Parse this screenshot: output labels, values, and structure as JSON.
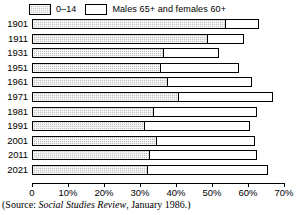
{
  "legend": {
    "entries": [
      {
        "label": "0–14",
        "style": "shaded",
        "name": "legend-swatch-young"
      },
      {
        "label": "Males 65+ and females 60+",
        "style": "open",
        "name": "legend-swatch-old"
      }
    ]
  },
  "axis": {
    "ticks": [
      {
        "value": 0,
        "label": "0"
      },
      {
        "value": 10,
        "label": "10%"
      },
      {
        "value": 20,
        "label": "20%"
      },
      {
        "value": 30,
        "label": "30%"
      },
      {
        "value": 40,
        "label": "40%"
      },
      {
        "value": 50,
        "label": "50%"
      },
      {
        "value": 60,
        "label": "60%"
      },
      {
        "value": 70,
        "label": "70%"
      }
    ]
  },
  "source": {
    "prefix": "(Source: ",
    "publication": "Social Studies Review",
    "suffix": ", January 1986.)"
  },
  "chart_data": {
    "type": "bar",
    "orientation": "horizontal",
    "stacked": true,
    "title": "",
    "xlabel": "",
    "ylabel": "",
    "xlim": [
      0,
      70
    ],
    "grid": false,
    "legend_position": "top",
    "categories": [
      "1901",
      "1911",
      "1931",
      "1951",
      "1961",
      "1971",
      "1981",
      "1991",
      "2001",
      "2011",
      "2021"
    ],
    "series": [
      {
        "name": "0–14",
        "values": [
          53.5,
          48.5,
          36.5,
          35.5,
          37.5,
          40.5,
          33.5,
          31.0,
          34.5,
          32.5,
          32.0
        ]
      },
      {
        "name": "Males 65+ and females 60+",
        "values": [
          9.5,
          10.5,
          15.5,
          22.0,
          23.5,
          26.5,
          29.0,
          29.5,
          27.5,
          30.0,
          33.5
        ]
      }
    ],
    "totals": [
      63.0,
      59.0,
      52.0,
      57.5,
      61.0,
      67.0,
      62.5,
      60.5,
      62.0,
      62.5,
      65.5
    ]
  }
}
